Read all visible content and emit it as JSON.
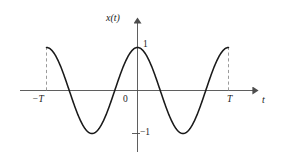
{
  "figure": {
    "name": "cosine-waveform-plot",
    "background_color": "#ffffff",
    "curve_color": "#1a1a1a",
    "axis_color": "#4d4d4d",
    "dashed_color": "#808080"
  },
  "labels": {
    "y_axis": "x(t)",
    "x_axis": "t",
    "origin": "0",
    "y_max": "1",
    "y_min": "−1",
    "x_min": "−T",
    "x_max": "T"
  },
  "chart_data": {
    "type": "line",
    "title": "",
    "xlabel": "t",
    "ylabel": "x(t)",
    "xlim": [
      -1.0,
      1.0
    ],
    "ylim": [
      -1.0,
      1.0
    ],
    "grid": false,
    "legend": null,
    "x_tick_labels": [
      "−T",
      "0",
      "T"
    ],
    "x_tick_values": [
      -1.0,
      0.0,
      1.0
    ],
    "y_tick_labels": [
      "1",
      "−1"
    ],
    "y_tick_values": [
      1.0,
      -1.0
    ],
    "equation": "x(t) = cos(2πt/T)",
    "period_label": "T",
    "amplitude": 1,
    "annotations": [
      {
        "type": "dashed-vertical",
        "x": -1.0,
        "y_from": 0.0,
        "y_to": 1.0
      },
      {
        "type": "dashed-vertical",
        "x": 1.0,
        "y_from": 0.0,
        "y_to": 1.0
      },
      {
        "type": "tick",
        "axis": "y",
        "value": -1.0
      }
    ],
    "series": [
      {
        "name": "x(t)",
        "x": [
          -1.0,
          -0.95,
          -0.9,
          -0.85,
          -0.8,
          -0.75,
          -0.7,
          -0.65,
          -0.6,
          -0.55,
          -0.5,
          -0.45,
          -0.4,
          -0.35,
          -0.3,
          -0.25,
          -0.2,
          -0.15,
          -0.1,
          -0.05,
          0.0,
          0.05,
          0.1,
          0.15,
          0.2,
          0.25,
          0.3,
          0.35,
          0.4,
          0.45,
          0.5,
          0.55,
          0.6,
          0.65,
          0.7,
          0.75,
          0.8,
          0.85,
          0.9,
          0.95,
          1.0
        ],
        "y": [
          1.0,
          0.951,
          0.809,
          0.588,
          0.309,
          0.0,
          -0.309,
          -0.588,
          -0.809,
          -0.951,
          -1.0,
          -0.951,
          -0.809,
          -0.588,
          -0.309,
          0.0,
          0.309,
          0.588,
          0.809,
          0.951,
          1.0,
          0.951,
          0.809,
          0.588,
          0.309,
          0.0,
          -0.309,
          -0.588,
          -0.809,
          -0.951,
          -1.0,
          -0.951,
          -0.809,
          -0.588,
          -0.309,
          0.0,
          0.309,
          0.588,
          0.809,
          0.951,
          1.0
        ]
      }
    ]
  }
}
